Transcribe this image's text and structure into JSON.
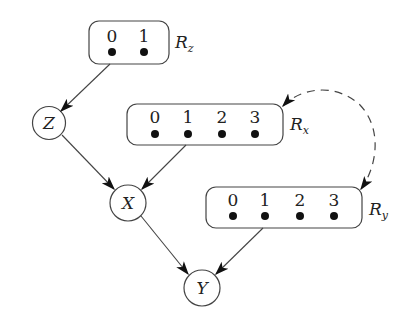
{
  "diagram": {
    "type": "causal-graph",
    "colors": {
      "stroke": "#444444",
      "fill": "#111111",
      "background": "#ffffff"
    },
    "nodes": [
      {
        "id": "Z",
        "label": "Z",
        "kind": "variable"
      },
      {
        "id": "X",
        "label": "X",
        "kind": "variable"
      },
      {
        "id": "Y",
        "label": "Y",
        "kind": "variable"
      }
    ],
    "response_functions": [
      {
        "id": "Rz",
        "label": "R",
        "subscript": "z",
        "values": [
          "0",
          "1"
        ]
      },
      {
        "id": "Rx",
        "label": "R",
        "subscript": "x",
        "values": [
          "0",
          "1",
          "2",
          "3"
        ]
      },
      {
        "id": "Ry",
        "label": "R",
        "subscript": "y",
        "values": [
          "0",
          "1",
          "2",
          "3"
        ]
      }
    ],
    "edges": [
      {
        "from": "Rz",
        "to": "Z",
        "style": "solid"
      },
      {
        "from": "Z",
        "to": "X",
        "style": "solid"
      },
      {
        "from": "Rx",
        "to": "X",
        "style": "solid"
      },
      {
        "from": "X",
        "to": "Y",
        "style": "solid"
      },
      {
        "from": "Ry",
        "to": "Y",
        "style": "solid"
      },
      {
        "from": "Rx",
        "to": "Ry",
        "style": "dashed",
        "bidirected": true
      }
    ]
  }
}
